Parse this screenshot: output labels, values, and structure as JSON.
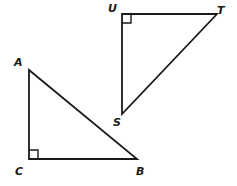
{
  "figure": {
    "background_color": "#ffffff",
    "stroke_color": "#1a1a1a",
    "label_color": "#1a1a1a",
    "stroke_width": 1.8,
    "triangles": [
      {
        "name": "triangle-abc",
        "vertices": [
          {
            "label": "A",
            "x": 29,
            "y": 70,
            "label_x": 14,
            "label_y": 57
          },
          {
            "label": "C",
            "x": 29,
            "y": 159,
            "label_x": 15,
            "label_y": 166
          },
          {
            "label": "B",
            "x": 137,
            "y": 159,
            "label_x": 136,
            "label_y": 166
          }
        ],
        "right_angle": {
          "at": "C",
          "marker": "right-angle-square",
          "size": 9,
          "dir_x": 1,
          "dir_y": -1
        },
        "points": "29,70 29,159 137,159"
      },
      {
        "name": "triangle-stu",
        "vertices": [
          {
            "label": "U",
            "x": 122,
            "y": 14,
            "label_x": 108,
            "label_y": 3
          },
          {
            "label": "T",
            "x": 217,
            "y": 14,
            "label_x": 217,
            "label_y": 5
          },
          {
            "label": "S",
            "x": 122,
            "y": 114,
            "label_x": 113,
            "label_y": 117
          }
        ],
        "right_angle": {
          "at": "U",
          "marker": "right-angle-square",
          "size": 9,
          "dir_x": 1,
          "dir_y": 1
        },
        "points": "122,14 217,14 122,114"
      }
    ]
  }
}
